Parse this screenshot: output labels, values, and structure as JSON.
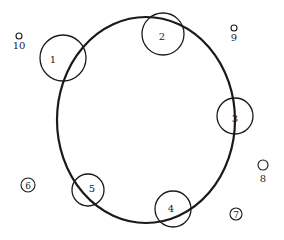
{
  "diagram": {
    "stroke_color": "#1a1a1a",
    "background": "#ffffff",
    "main_ellipse": {
      "cx": 146,
      "cy": 120,
      "rx": 89,
      "ry": 103
    },
    "large_circles": [
      {
        "label": "1",
        "cx": 63,
        "cy": 58,
        "r": 23,
        "lx": 53,
        "ly": 63
      },
      {
        "label": "2",
        "cx": 163,
        "cy": 34,
        "r": 21,
        "lx": 162,
        "ly": 40
      },
      {
        "label": "3",
        "cx": 235,
        "cy": 116,
        "r": 18,
        "lx": 235,
        "ly": 122
      },
      {
        "label": "4",
        "cx": 173,
        "cy": 209,
        "r": 18,
        "lx": 171,
        "ly": 212
      },
      {
        "label": "5",
        "cx": 88,
        "cy": 190,
        "r": 16,
        "lx": 92,
        "ly": 192
      }
    ],
    "small_markers": [
      {
        "label": "10",
        "cx": 19,
        "cy": 36,
        "r": 3,
        "lx": 19,
        "ly": 49,
        "label_inside": false
      },
      {
        "label": "9",
        "cx": 234,
        "cy": 28,
        "r": 3,
        "lx": 234,
        "ly": 41,
        "label_inside": false
      },
      {
        "label": "8",
        "cx": 263,
        "cy": 165,
        "r": 5,
        "lx": 263,
        "ly": 182,
        "label_inside": false
      },
      {
        "label": "6",
        "cx": 28,
        "cy": 185,
        "r": 7,
        "lx": 28,
        "ly": 189,
        "label_inside": true
      },
      {
        "label": "7",
        "cx": 236,
        "cy": 214,
        "r": 6,
        "lx": 236,
        "ly": 218,
        "label_inside": true
      }
    ]
  }
}
